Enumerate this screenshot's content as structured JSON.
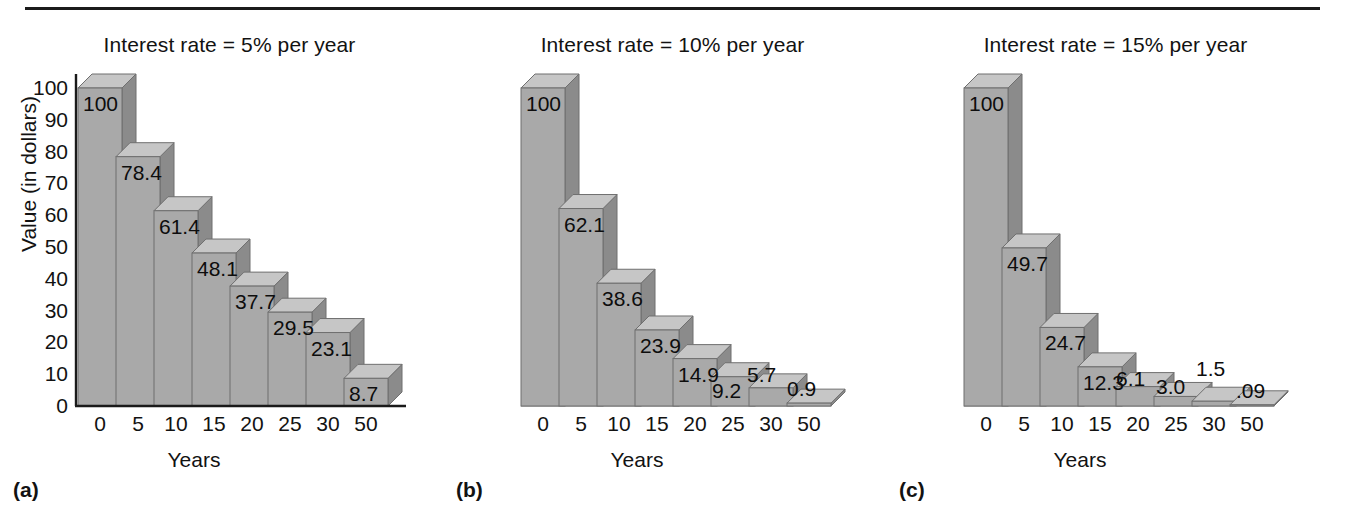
{
  "figure": {
    "rule": "horizontal-rule",
    "panels": [
      {
        "letter": "(a)",
        "title": "Interest rate = 5% per year",
        "rate": "5%",
        "values": [
          "100",
          "78.4",
          "61.4",
          "48.1",
          "37.7",
          "29.5",
          "23.1",
          "8.7"
        ],
        "show_yaxis": true
      },
      {
        "letter": "(b)",
        "title": "Interest rate = 10% per year",
        "rate": "10%",
        "values": [
          "100",
          "62.1",
          "38.6",
          "23.9",
          "14.9",
          "9.2",
          "5.7",
          "0.9"
        ],
        "show_yaxis": false
      },
      {
        "letter": "(c)",
        "title": "Interest rate = 15% per year",
        "rate": "15%",
        "values": [
          "100",
          "49.7",
          "24.7",
          "12.3",
          "6.1",
          "3.0",
          "1.5",
          ".09"
        ],
        "show_yaxis": false
      }
    ],
    "yticks": [
      "100",
      "90",
      "80",
      "70",
      "60",
      "50",
      "40",
      "30",
      "20",
      "10",
      "0"
    ],
    "ylabel": "Value (in dollars)",
    "xticks": [
      "0",
      "5",
      "10",
      "15",
      "20",
      "25",
      "30",
      "50"
    ],
    "xlabel": "Years",
    "colors": {
      "bar_front": "#a9a9a9",
      "bar_top": "#c6c6c6",
      "bar_side": "#8b8b8b",
      "bar_edge": "#6f6f6f",
      "axis": "#1a1a1a",
      "text": "#111111"
    }
  },
  "chart_data": {
    "type": "bar",
    "xlabel": "Years",
    "ylabel": "Value (in dollars)",
    "categories": [
      "0",
      "5",
      "10",
      "15",
      "20",
      "25",
      "30",
      "50"
    ],
    "ylim": [
      0,
      100
    ],
    "ytick_values": [
      0,
      10,
      20,
      30,
      40,
      50,
      60,
      70,
      80,
      90,
      100
    ],
    "grid": false,
    "legend": "none",
    "panels": [
      {
        "label": "(a)",
        "title": "Interest rate = 5% per year",
        "rate_percent": 5,
        "values": [
          100,
          78.4,
          61.4,
          48.1,
          37.7,
          29.5,
          23.1,
          8.7
        ],
        "data_labels": [
          "100",
          "78.4",
          "61.4",
          "48.1",
          "37.7",
          "29.5",
          "23.1",
          "8.7"
        ]
      },
      {
        "label": "(b)",
        "title": "Interest rate = 10% per year",
        "rate_percent": 10,
        "values": [
          100,
          62.1,
          38.6,
          23.9,
          14.9,
          9.2,
          5.7,
          0.9
        ],
        "data_labels": [
          "100",
          "62.1",
          "38.6",
          "23.9",
          "14.9",
          "9.2",
          "5.7",
          "0.9"
        ]
      },
      {
        "label": "(c)",
        "title": "Interest rate = 15% per year",
        "rate_percent": 15,
        "values": [
          100,
          49.7,
          24.7,
          12.3,
          6.1,
          3.0,
          1.5,
          0.09
        ],
        "data_labels": [
          "100",
          "49.7",
          "24.7",
          "12.3",
          "6.1",
          "3.0",
          "1.5",
          ".09"
        ]
      }
    ]
  }
}
